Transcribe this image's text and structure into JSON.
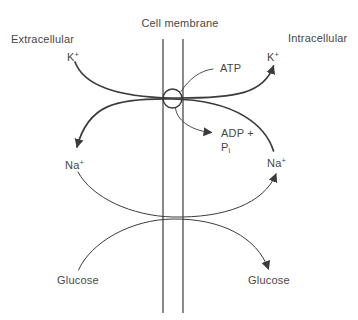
{
  "title": "Cell membrane",
  "regions": {
    "left": "Extracellular",
    "right": "Intracellular"
  },
  "ions": {
    "potassium": "K",
    "sodium": "Na",
    "charge_sign": "+"
  },
  "energy": {
    "atp": "ATP",
    "adp": "ADP +",
    "phosphate": "P",
    "phosphate_subscript": "i"
  },
  "substrate": {
    "glucose": "Glucose"
  },
  "colors": {
    "line": "#3b3b3b",
    "text": "#474747",
    "background": "#ffffff"
  }
}
